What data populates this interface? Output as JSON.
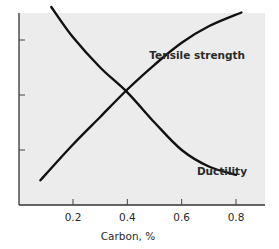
{
  "chart_data": {
    "type": "line",
    "title": "",
    "xlabel": "Carbon, %",
    "ylabel": "",
    "xlim": [
      0.0,
      0.9
    ],
    "ylim": [
      0,
      4
    ],
    "x_ticks": [
      0.2,
      0.4,
      0.6,
      0.8
    ],
    "x_tick_labels": [
      "0.2",
      "0.4",
      "0.6",
      "0.8"
    ],
    "y_ticks": [
      1,
      2,
      3
    ],
    "y_tick_labels": [
      "",
      "",
      ""
    ],
    "grid": false,
    "legend": "inline labels",
    "series": [
      {
        "name": "Tensile strength",
        "label_position": "upper right, above curve end",
        "x": [
          0.08,
          0.2,
          0.3,
          0.4,
          0.5,
          0.6,
          0.7,
          0.82
        ],
        "y": [
          0.45,
          1.1,
          1.6,
          2.1,
          2.55,
          2.95,
          3.25,
          3.5
        ]
      },
      {
        "name": "Ductility",
        "label_position": "lower right, above curve end",
        "x": [
          0.12,
          0.2,
          0.3,
          0.4,
          0.5,
          0.6,
          0.7,
          0.8
        ],
        "y": [
          3.6,
          3.05,
          2.5,
          2.05,
          1.5,
          1.0,
          0.7,
          0.55
        ]
      }
    ]
  },
  "labels": {
    "tensile": "Tensile strength",
    "ductility": "Ductility",
    "xlabel": "Carbon, %"
  },
  "colors": {
    "plot_background": "#ececec",
    "page_background": "#ffffff",
    "line": "#111111",
    "axis": "#333333"
  }
}
